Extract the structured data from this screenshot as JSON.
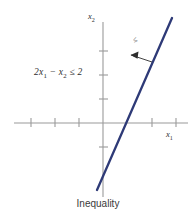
{
  "figure": {
    "caption": "Inequality",
    "background_color": "#ffffff"
  },
  "axes": {
    "x_axis_label": "x1",
    "y_axis_label": "x2",
    "axis_color": "#9a9a9a",
    "origin_px": {
      "x": 103,
      "y": 123
    },
    "tick_spacing_px": 24,
    "x_ticks": [
      -3,
      -2,
      -1,
      1,
      2
    ],
    "y_ticks": [
      -1,
      1,
      2,
      3
    ]
  },
  "annotations": {
    "inequality_expression": "2x1 − x2 ≤ 2",
    "half_plane_symbol": "≤",
    "arrow_direction": "down-left"
  },
  "chart_data": {
    "type": "line",
    "title": "Inequality",
    "xlabel": "x1",
    "ylabel": "x2",
    "grid": false,
    "legend": null,
    "xlim": [
      -3.7,
      3.5
    ],
    "ylim": [
      -2.9,
      4.2
    ],
    "series": [
      {
        "name": "2x1 - x2 = 2",
        "equation": "x2 = 2*x1 - 2",
        "slope": 2,
        "intercept": -2,
        "color": "#2e3a77",
        "linewidth": 2.2,
        "x": [
          -0.25,
          2.88
        ],
        "y": [
          -2.5,
          3.76
        ],
        "x_intercept": 1,
        "y_intercept": -2
      }
    ],
    "shaded_region": {
      "inequality": "2x1 - x2 ≤ 2",
      "side": "upper-left",
      "marker": "arrow"
    }
  }
}
